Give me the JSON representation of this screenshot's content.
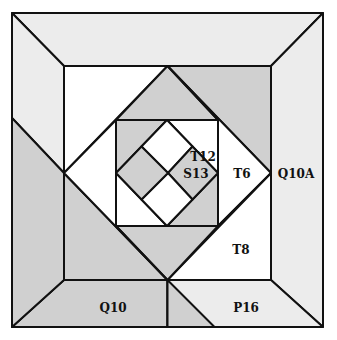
{
  "diagram": {
    "colors": {
      "light": "#ececec",
      "medium": "#d0d0d0",
      "white": "#ffffff",
      "line": "#111111"
    },
    "labels": {
      "t12": "T12",
      "s13": "S13",
      "t6": "T6",
      "q10a": "Q10A",
      "t8": "T8",
      "q10": "Q10",
      "p16": "P16"
    }
  }
}
